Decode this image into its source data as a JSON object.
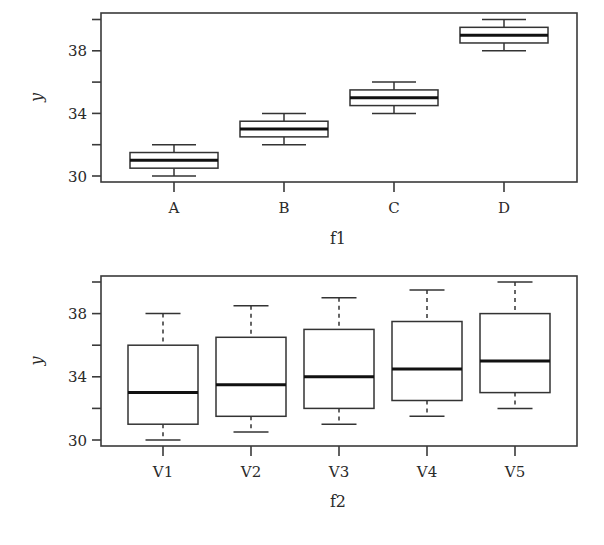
{
  "chart_data": [
    {
      "type": "box",
      "panel": "top",
      "title": "",
      "xlabel": "f1",
      "ylabel": "y",
      "ylim": [
        29.8,
        40.2
      ],
      "yticks": [
        30,
        32,
        34,
        36,
        38,
        40
      ],
      "ytick_labels": [
        "30",
        "",
        "34",
        "",
        "38",
        ""
      ],
      "categories": [
        "A",
        "B",
        "C",
        "D"
      ],
      "boxes": [
        {
          "label": "A",
          "whisker_low": 30,
          "q1": 30.5,
          "median": 31,
          "q3": 31.5,
          "whisker_high": 32
        },
        {
          "label": "B",
          "whisker_low": 32,
          "q1": 32.5,
          "median": 33,
          "q3": 33.5,
          "whisker_high": 34
        },
        {
          "label": "C",
          "whisker_low": 34,
          "q1": 34.5,
          "median": 35,
          "q3": 35.5,
          "whisker_high": 36
        },
        {
          "label": "D",
          "whisker_low": 38,
          "q1": 38.5,
          "median": 39,
          "q3": 39.5,
          "whisker_high": 40
        }
      ],
      "whisker_style": "solid",
      "grid": false
    },
    {
      "type": "box",
      "panel": "bottom",
      "title": "",
      "xlabel": "f2",
      "ylabel": "y",
      "ylim": [
        29.8,
        40.2
      ],
      "yticks": [
        30,
        32,
        34,
        36,
        38,
        40
      ],
      "ytick_labels": [
        "30",
        "",
        "34",
        "",
        "38",
        ""
      ],
      "categories": [
        "V1",
        "V2",
        "V3",
        "V4",
        "V5"
      ],
      "boxes": [
        {
          "label": "V1",
          "whisker_low": 30,
          "q1": 31,
          "median": 33,
          "q3": 36,
          "whisker_high": 38
        },
        {
          "label": "V2",
          "whisker_low": 30.5,
          "q1": 31.5,
          "median": 33.5,
          "q3": 36.5,
          "whisker_high": 38.5
        },
        {
          "label": "V3",
          "whisker_low": 31,
          "q1": 32,
          "median": 34,
          "q3": 37,
          "whisker_high": 39
        },
        {
          "label": "V4",
          "whisker_low": 31.5,
          "q1": 32.5,
          "median": 34.5,
          "q3": 37.5,
          "whisker_high": 39.5
        },
        {
          "label": "V5",
          "whisker_low": 32,
          "q1": 33,
          "median": 35,
          "q3": 38,
          "whisker_high": 40
        }
      ],
      "whisker_style": "dashed",
      "grid": false
    }
  ],
  "colors": {
    "frame": "#3a3a3a",
    "box_fill": "#ffffff",
    "median": "#111111",
    "text": "#2a2a2a"
  }
}
